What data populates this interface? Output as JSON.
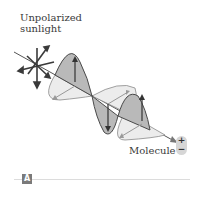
{
  "figure": {
    "title_line1": "Unpolarized",
    "title_line2": "sunlight",
    "molecule_label": "Molecule",
    "charge_plus": "+",
    "charge_minus": "−",
    "panel_label": "A"
  },
  "colors": {
    "vertical_wave_fill": "#b9b9b9",
    "horizontal_wave_fill": "#ececec",
    "stroke": "#4a4a4a",
    "axis": "#555555"
  },
  "icons": {
    "sunlight": "sunburst-arrows-icon",
    "charge": "dipole-charge-icon"
  }
}
